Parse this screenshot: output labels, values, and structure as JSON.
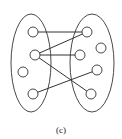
{
  "caption": "(c)",
  "colors": {
    "stroke": "#333333",
    "background": "#ffffff"
  },
  "graph": {
    "type": "bipartite",
    "left_set": {
      "ellipse": {
        "cx": 31,
        "cy": 63,
        "rx": 20,
        "ry": 49
      },
      "nodes": [
        {
          "id": "L1",
          "x": 33,
          "y": 32
        },
        {
          "id": "L2",
          "x": 35,
          "y": 55
        },
        {
          "id": "L3",
          "x": 23,
          "y": 72
        },
        {
          "id": "L4",
          "x": 33,
          "y": 94
        }
      ]
    },
    "right_set": {
      "ellipse": {
        "cx": 92,
        "cy": 63,
        "rx": 22,
        "ry": 49
      },
      "nodes": [
        {
          "id": "R1",
          "x": 87,
          "y": 32
        },
        {
          "id": "R2",
          "x": 80,
          "y": 55
        },
        {
          "id": "R3",
          "x": 101,
          "y": 48
        },
        {
          "id": "R4",
          "x": 97,
          "y": 70
        },
        {
          "id": "R5",
          "x": 91,
          "y": 94
        }
      ]
    },
    "edges": [
      [
        "L1",
        "R1"
      ],
      [
        "L2",
        "R1"
      ],
      [
        "L2",
        "R2"
      ],
      [
        "L2",
        "R5"
      ],
      [
        "L4",
        "R4"
      ]
    ]
  }
}
